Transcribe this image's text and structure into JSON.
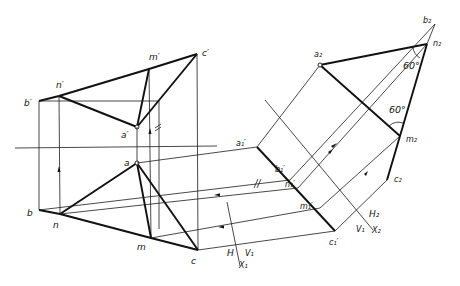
{
  "figure": {
    "title": ""
  },
  "labels": {
    "front": {
      "a_prime": "a′",
      "b_prime": "b′",
      "c_prime": "c′",
      "m_prime": "m′",
      "n_prime": "n′"
    },
    "top": {
      "a": "a",
      "b": "b",
      "c": "c",
      "m": "m",
      "n": "n"
    },
    "aux1": {
      "a1": "a₁′",
      "b1": "b₁′",
      "n1": "n₁′",
      "m1": "m₁′",
      "c1": "c₁′"
    },
    "aux2": {
      "a2": "a₂",
      "b2": "b₂",
      "n2": "n₂",
      "m2": "m₂",
      "c2": "c₂"
    },
    "axes": {
      "x1": "X₁",
      "h": "H",
      "v1_a": "V₁",
      "x2": "X₂",
      "h2": "H₂",
      "v1_b": "V₁"
    },
    "angles": {
      "angle_top": "60°",
      "angle_bottom": "60°"
    },
    "parallel_marks": {
      "front": "//",
      "aux": "//"
    }
  },
  "points": {
    "b_prime": [
      39,
      101
    ],
    "n_prime": [
      59,
      96
    ],
    "m_prime": [
      149,
      69
    ],
    "c_prime": [
      197,
      54
    ],
    "a_prime": [
      137,
      127
    ],
    "a": [
      137,
      163
    ],
    "b": [
      39,
      210
    ],
    "n": [
      60,
      214
    ],
    "m": [
      151,
      238
    ],
    "c": [
      198,
      250
    ],
    "a1": [
      257,
      147
    ],
    "b1": [
      290,
      180
    ],
    "n1": [
      298,
      188
    ],
    "m1": [
      320,
      208
    ],
    "c1": [
      335,
      231
    ],
    "a2": [
      320,
      65
    ],
    "b2": [
      435,
      24
    ],
    "n2": [
      427,
      44
    ],
    "m2": [
      400,
      136
    ],
    "c2": [
      387,
      180
    ]
  }
}
